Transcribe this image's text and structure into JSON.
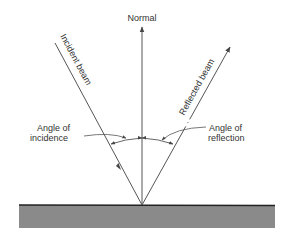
{
  "diagram": {
    "labels": {
      "normal": "Normal",
      "incident_beam": "Incident beam",
      "reflected_beam": "Reflected beam",
      "angle_incidence_line1": "Angle of",
      "angle_incidence_line2": "incidence",
      "angle_reflection_line1": "Angle of",
      "angle_reflection_line2": "reflection"
    },
    "colors": {
      "line": "#555555",
      "surface_fill": "#8a8a8a",
      "surface_edge": "#222222",
      "text": "#333333"
    }
  }
}
